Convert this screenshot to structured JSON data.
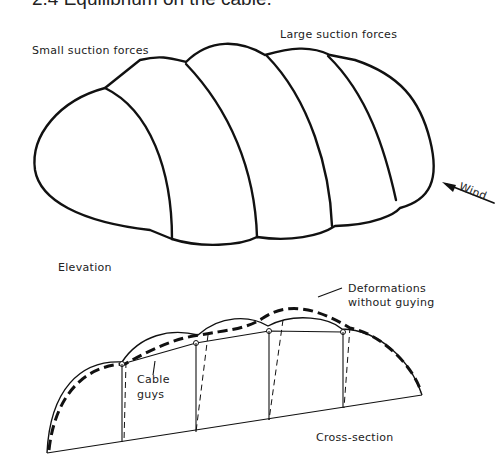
{
  "figure": {
    "title": "2.4 Equilibrium on the cable.",
    "elevation": {
      "label": "Elevation",
      "small_suction_label": "Small suction forces",
      "large_suction_label": "Large suction forces",
      "wind_label": "Wind"
    },
    "cross_section": {
      "label": "Cross-section",
      "cable_guys_label_line1": "Cable",
      "cable_guys_label_line2": "guys",
      "deformation_label_line1": "Deformations",
      "deformation_label_line2": "without  guying"
    }
  }
}
